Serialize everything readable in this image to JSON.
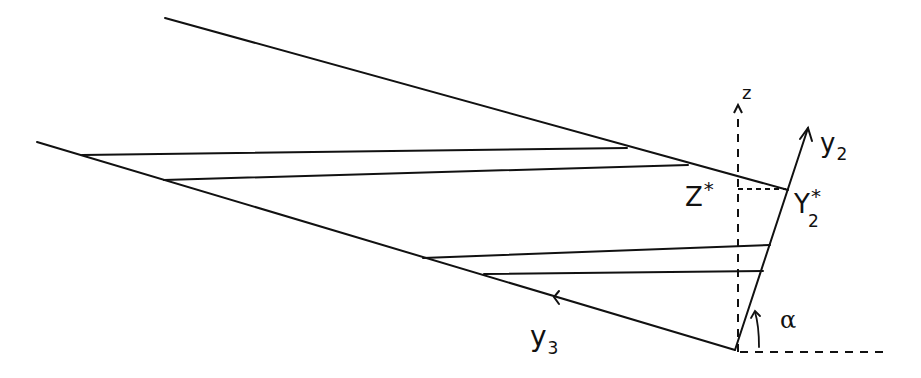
{
  "diagram": {
    "type": "geometric-construction",
    "labels": {
      "z_axis": "z",
      "y2_axis": "y",
      "y2_sub": "2",
      "y3_axis": "y",
      "y3_sub": "3",
      "z_star": "Z",
      "z_star_sup": "*",
      "y2_star": "Y",
      "y2_star_sub": "2",
      "y2_star_sup": "*",
      "angle": "α"
    },
    "colors": {
      "ink": "#111111",
      "background": "#ffffff"
    },
    "lines": [
      {
        "name": "upper-boundary",
        "from": [
          165,
          18
        ],
        "to": [
          788,
          190
        ]
      },
      {
        "name": "lower-boundary-y3",
        "from": [
          37,
          142
        ],
        "to": [
          735,
          350
        ]
      },
      {
        "name": "upper-chord-1",
        "from": [
          82,
          155
        ],
        "to": [
          627,
          148
        ]
      },
      {
        "name": "upper-chord-2",
        "from": [
          164,
          180
        ],
        "to": [
          688,
          165
        ]
      },
      {
        "name": "lower-chord-1",
        "from": [
          423,
          258
        ],
        "to": [
          770,
          245
        ]
      },
      {
        "name": "lower-chord-2",
        "from": [
          484,
          274
        ],
        "to": [
          763,
          271
        ]
      },
      {
        "name": "y2-axis",
        "from": [
          735,
          350
        ],
        "to": [
          808,
          128
        ]
      }
    ],
    "dashed_lines": [
      {
        "name": "z-axis",
        "from": [
          738,
          352
        ],
        "to": [
          738,
          105
        ]
      },
      {
        "name": "horizontal-reference",
        "from": [
          738,
          352
        ],
        "to": [
          890,
          352
        ]
      },
      {
        "name": "z-star-projection",
        "from": [
          738,
          189
        ],
        "to": [
          788,
          189
        ]
      }
    ]
  }
}
